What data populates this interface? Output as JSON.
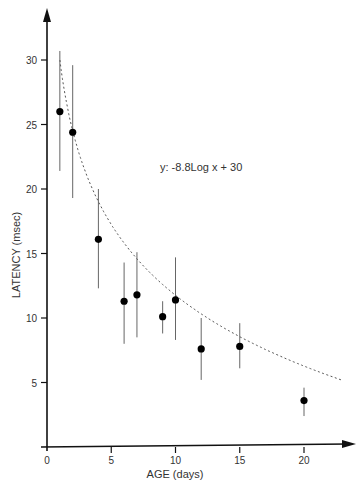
{
  "chart_data": {
    "type": "scatter",
    "title": "",
    "xlabel": "AGE (days)",
    "ylabel": "LATENCY (msec)",
    "xlim": [
      0,
      24
    ],
    "ylim": [
      0,
      33
    ],
    "x_ticks": [
      0,
      5,
      10,
      15,
      20
    ],
    "y_ticks": [
      5,
      10,
      15,
      20,
      25,
      30
    ],
    "grid": false,
    "legend": null,
    "annotation": "y: -8.8Log x + 30",
    "series": [
      {
        "name": "Latency measurements (mean ± error)",
        "points": [
          {
            "x": 1,
            "y": 26.0,
            "err_low": 21.4,
            "err_high": 30.7
          },
          {
            "x": 2,
            "y": 24.4,
            "err_low": 19.3,
            "err_high": 29.6
          },
          {
            "x": 4,
            "y": 16.1,
            "err_low": 12.3,
            "err_high": 20.0
          },
          {
            "x": 6,
            "y": 11.3,
            "err_low": 8.0,
            "err_high": 14.3
          },
          {
            "x": 7,
            "y": 11.8,
            "err_low": 8.5,
            "err_high": 15.1
          },
          {
            "x": 9,
            "y": 10.1,
            "err_low": 8.8,
            "err_high": 11.3
          },
          {
            "x": 10,
            "y": 11.4,
            "err_low": 8.3,
            "err_high": 14.7
          },
          {
            "x": 12,
            "y": 7.6,
            "err_low": 5.2,
            "err_high": 10.0
          },
          {
            "x": 15,
            "y": 7.8,
            "err_low": 6.1,
            "err_high": 9.6
          },
          {
            "x": 20,
            "y": 3.6,
            "err_low": 2.4,
            "err_high": 4.6
          }
        ]
      },
      {
        "name": "Fit: y = -8.8 log x + 30",
        "type": "line",
        "style": "dashed",
        "fit": {
          "a": -8.8,
          "b": 30,
          "x_range": [
            1,
            23
          ]
        }
      }
    ]
  },
  "labels": {
    "xlabel": "AGE (days)",
    "ylabel": "LATENCY (msec)",
    "equation": "y: -8.8Log x + 30"
  }
}
